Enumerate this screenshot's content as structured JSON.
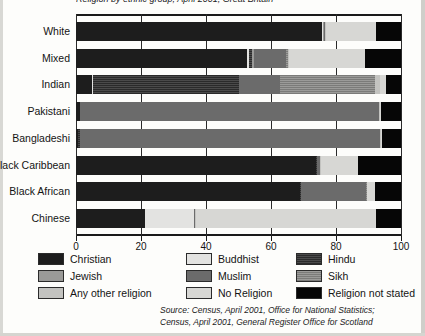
{
  "title": "Religion by ethnic group, April 2001, Great Britain",
  "axis": {
    "x_ticks": [
      "0",
      "20",
      "40",
      "60",
      "80",
      "100"
    ],
    "x_min": 0,
    "x_max": 100
  },
  "legend": [
    {
      "key": "christian",
      "label": "Christian",
      "swatch": "p-christian"
    },
    {
      "key": "jewish",
      "label": "Jewish",
      "swatch": "p-jewish"
    },
    {
      "key": "other",
      "label": "Any other religion",
      "swatch": "p-other"
    },
    {
      "key": "buddhist",
      "label": "Buddhist",
      "swatch": "p-buddhist"
    },
    {
      "key": "muslim",
      "label": "Muslim",
      "swatch": "p-muslim"
    },
    {
      "key": "norel",
      "label": "No Religion",
      "swatch": "p-norel"
    },
    {
      "key": "hindu",
      "label": "Hindu",
      "swatch": "p-hindu"
    },
    {
      "key": "sikh",
      "label": "Sikh",
      "swatch": "p-sikh"
    },
    {
      "key": "notstated",
      "label": "Religion not stated",
      "swatch": "p-notstated"
    }
  ],
  "source": {
    "line1": "Source: Census, April 2001, Office for National Statistics;",
    "line2": "Census, April 2001, General Register Office for Scotland"
  },
  "chart_data": {
    "type": "bar",
    "orientation": "horizontal",
    "stacked": true,
    "percent": true,
    "title": "Religion by ethnic group, April 2001, Great Britain",
    "xlabel": "",
    "ylabel": "",
    "xlim": [
      0,
      100
    ],
    "xticks": [
      0,
      20,
      40,
      60,
      80,
      100
    ],
    "grid": true,
    "legend_position": "bottom",
    "categories": [
      "White",
      "Mixed",
      "Indian",
      "Pakistani",
      "Bangladeshi",
      "Black Caribbean",
      "Black African",
      "Chinese"
    ],
    "series": [
      {
        "name": "Christian",
        "values": [
          75.7,
          52.5,
          4.9,
          1.1,
          0.5,
          73.7,
          68.9,
          21.1
        ]
      },
      {
        "name": "Buddhist",
        "values": [
          0.2,
          0.7,
          0.2,
          0.0,
          0.0,
          0.3,
          0.1,
          15.1
        ]
      },
      {
        "name": "Hindu",
        "values": [
          0.0,
          1.0,
          45.0,
          0.1,
          0.6,
          0.2,
          0.2,
          0.1
        ]
      },
      {
        "name": "Jewish",
        "values": [
          0.5,
          0.6,
          0.1,
          0.0,
          0.0,
          0.1,
          0.1,
          0.0
        ]
      },
      {
        "name": "Muslim",
        "values": [
          0.2,
          9.8,
          12.7,
          91.9,
          92.5,
          0.8,
          20.0,
          0.2
        ]
      },
      {
        "name": "Sikh",
        "values": [
          0.0,
          0.6,
          29.1,
          0.1,
          0.0,
          0.0,
          0.1,
          0.0
        ]
      },
      {
        "name": "Any other religion",
        "values": [
          0.3,
          0.5,
          1.7,
          0.2,
          0.2,
          0.3,
          0.3,
          0.4
        ]
      },
      {
        "name": "No Religion",
        "values": [
          15.3,
          23.3,
          1.7,
          0.5,
          0.4,
          11.3,
          2.3,
          55.4
        ]
      },
      {
        "name": "Religion not stated",
        "values": [
          7.8,
          11.0,
          4.6,
          6.1,
          5.8,
          13.3,
          8.0,
          7.7
        ]
      }
    ]
  }
}
